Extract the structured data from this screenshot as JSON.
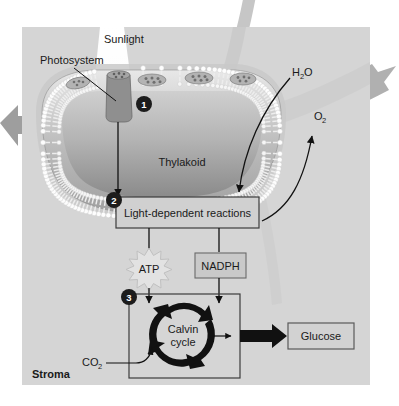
{
  "figure": {
    "background_color": "#ffffff",
    "panel_color": "#d5d5d5",
    "stroma_label": "Stroma"
  },
  "labels": {
    "sunlight": "Sunlight",
    "photosystem": "Photosystem",
    "thylakoid": "Thylakoid",
    "water": "H",
    "water_sub": "2",
    "water_tail": "O",
    "oxygen": "O",
    "oxygen_sub": "2",
    "carbon_dioxide": "CO",
    "carbon_dioxide_sub": "2",
    "stroma": "Stroma"
  },
  "boxes": [
    {
      "id": "light-reactions",
      "label": "Light-dependent reactions",
      "fill": "#d0d0d0",
      "stroke": "#3c3c3c"
    },
    {
      "id": "nadph",
      "label": "NADPH",
      "fill": "#c9c9c9",
      "stroke": "#6a6a6a"
    },
    {
      "id": "glucose",
      "label": "Glucose",
      "fill": "#d2d2d2",
      "stroke": "#5a5a5a"
    },
    {
      "id": "calvin-box",
      "label": "",
      "fill": "none",
      "stroke": "#3c3c3c"
    }
  ],
  "burst": {
    "id": "atp",
    "label": "ATP",
    "fill": "#e2e2e2",
    "stroke": "#c0c0c0"
  },
  "cycle": {
    "label_line1": "Calvin",
    "label_line2": "cycle",
    "arrow_color": "#111111"
  },
  "steps": [
    {
      "number": "1",
      "meaning": "light absorbed by photosystem"
    },
    {
      "number": "2",
      "meaning": "light-dependent reactions"
    },
    {
      "number": "3",
      "meaning": "Calvin cycle"
    }
  ],
  "colors": {
    "panel": "#d5d5d5",
    "membrane_light": "#f2f2f2",
    "membrane_mid": "#9a9a9a",
    "lumen_dark": "#8d8d8d",
    "arrow_black": "#111111",
    "arrow_gray": "#a8a8a8",
    "badge": "#1c1c1c",
    "photosystem_fill": "#8a8a8a",
    "sunbeam": "#ffffff"
  },
  "flows": [
    {
      "from": "photosystem",
      "to": "light-dependent reactions",
      "type": "straight-arrow"
    },
    {
      "from": "H2O",
      "to": "light-dependent reactions",
      "type": "curved-arrow"
    },
    {
      "from": "light-dependent reactions",
      "to": "O2",
      "type": "curved-arrow"
    },
    {
      "from": "light-dependent reactions",
      "to": "ATP",
      "type": "line"
    },
    {
      "from": "light-dependent reactions",
      "to": "NADPH",
      "type": "line"
    },
    {
      "from": "ATP",
      "to": "Calvin cycle",
      "type": "arrow"
    },
    {
      "from": "NADPH",
      "to": "Calvin cycle",
      "type": "arrow"
    },
    {
      "from": "CO2",
      "to": "Calvin cycle",
      "type": "curved-arrow"
    },
    {
      "from": "Calvin cycle",
      "to": "Glucose",
      "type": "thick-arrow"
    }
  ]
}
